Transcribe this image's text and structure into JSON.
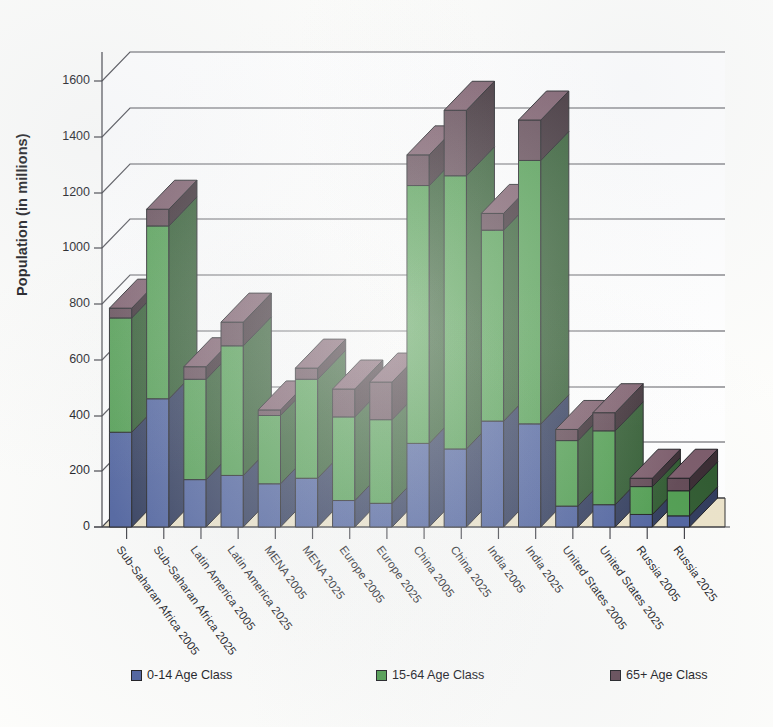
{
  "chart_data": {
    "type": "bar",
    "subtype": "stacked-3d-column",
    "title": "",
    "xlabel": "",
    "ylabel": "Population (in millions)",
    "ylim": [
      0,
      1700
    ],
    "yticks": [
      0,
      200,
      400,
      600,
      800,
      1000,
      1200,
      1400,
      1600
    ],
    "ytick_labels": [
      "0",
      "200",
      "400",
      "600",
      "800",
      "1000",
      "1200",
      "1400",
      "1600"
    ],
    "grid": true,
    "legend_position": "bottom",
    "categories": [
      "Sub-Saharan Africa 2005",
      "Sub-Saharan Africa 2025",
      "Latin America 2005",
      "Latin America 2025",
      "MENA 2005",
      "MENA 2025",
      "Europe 2005",
      "Europe 2025",
      "China 2005",
      "China 2025",
      "India 2005",
      "India 2025",
      "United States 2005",
      "United States 2025",
      "Russia 2005",
      "Russia 2025"
    ],
    "series": [
      {
        "name": "0-14 Age Class",
        "color": "#4a5e9c",
        "values": [
          340,
          460,
          170,
          185,
          155,
          175,
          95,
          85,
          300,
          280,
          380,
          370,
          75,
          80,
          45,
          40
        ]
      },
      {
        "name": "15-64 Age Class",
        "color": "#4b9b4b",
        "values": [
          410,
          620,
          360,
          465,
          245,
          355,
          300,
          300,
          925,
          980,
          685,
          945,
          235,
          265,
          100,
          90
        ]
      },
      {
        "name": "65+ Age Class",
        "color": "#5e4450",
        "values": [
          35,
          60,
          45,
          85,
          20,
          40,
          100,
          135,
          110,
          235,
          60,
          145,
          40,
          65,
          30,
          45
        ]
      }
    ],
    "totals": [
      785,
      1140,
      575,
      735,
      420,
      570,
      495,
      520,
      1335,
      1495,
      1125,
      1460,
      350,
      410,
      175,
      175
    ]
  },
  "axis": {
    "y_title": "Population (in millions)"
  },
  "legend": {
    "items": [
      {
        "label": "0-14 Age Class",
        "color": "#4a5e9c"
      },
      {
        "label": "15-64 Age Class",
        "color": "#4b9b4b"
      },
      {
        "label": "65+ Age Class",
        "color": "#5e4450"
      }
    ]
  }
}
